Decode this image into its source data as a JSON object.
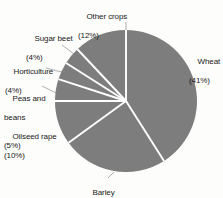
{
  "chart_data": {
    "type": "pie",
    "title": "",
    "subtitle": "",
    "xlabel": "",
    "ylabel": "",
    "legend_position": "none",
    "grid": false,
    "unit": "%",
    "start_angle_deg": 0,
    "direction": "clockwise",
    "categories": [
      "Wheat",
      "Barley",
      "Oilseed rape",
      "Peas and beans",
      "Horticulture",
      "Sugar beet",
      "Other crops"
    ],
    "values": [
      41,
      24,
      10,
      5,
      4,
      4,
      12
    ],
    "slices": [
      {
        "name": "Wheat",
        "value": 41,
        "label": "Wheat",
        "pct_label": "(41%)",
        "color": "#7d7d7d"
      },
      {
        "name": "Barley",
        "value": 24,
        "label": "Barley",
        "pct_label": "(24%)",
        "color": "#7d7d7d"
      },
      {
        "name": "Oilseed rape",
        "value": 10,
        "label": "Oilseed rape",
        "pct_label": "(10%)",
        "color": "#7d7d7d"
      },
      {
        "name": "Peas and beans",
        "value": 5,
        "label_line1": "Peas and",
        "label_line2": "beans",
        "pct_label": "(5%)",
        "color": "#7d7d7d"
      },
      {
        "name": "Horticulture",
        "value": 4,
        "label": "Horticulture",
        "pct_label": "(4%)",
        "color": "#7d7d7d"
      },
      {
        "name": "Sugar beet",
        "value": 4,
        "label": "Sugar beet",
        "pct_label": "(4%)",
        "color": "#7d7d7d"
      },
      {
        "name": "Other crops",
        "value": 12,
        "label": "Other crops",
        "pct_label": "(12%)",
        "color": "#7d7d7d"
      }
    ]
  },
  "colors": {
    "slice_fill": "#7d7d7d",
    "separator": "#ffffff",
    "leader_line": "#8d8d8d",
    "text": "#1a1a1a",
    "background": "#fdfdfc"
  },
  "labels": {
    "wheat_name": "Wheat",
    "wheat_pct": "(41%)",
    "barley_name": "Barley",
    "barley_pct": "(24%)",
    "oilseed_name": "Oilseed rape",
    "oilseed_pct": "(10%)",
    "peas_name_1": "Peas and",
    "peas_name_2": "beans",
    "peas_pct": "(5%)",
    "horticulture_name": "Horticulture",
    "horticulture_pct": "(4%)",
    "sugarbeet_name": "Sugar beet",
    "sugarbeet_pct": "(4%)",
    "othercrops_name": "Other crops",
    "othercrops_pct": "(12%)"
  }
}
